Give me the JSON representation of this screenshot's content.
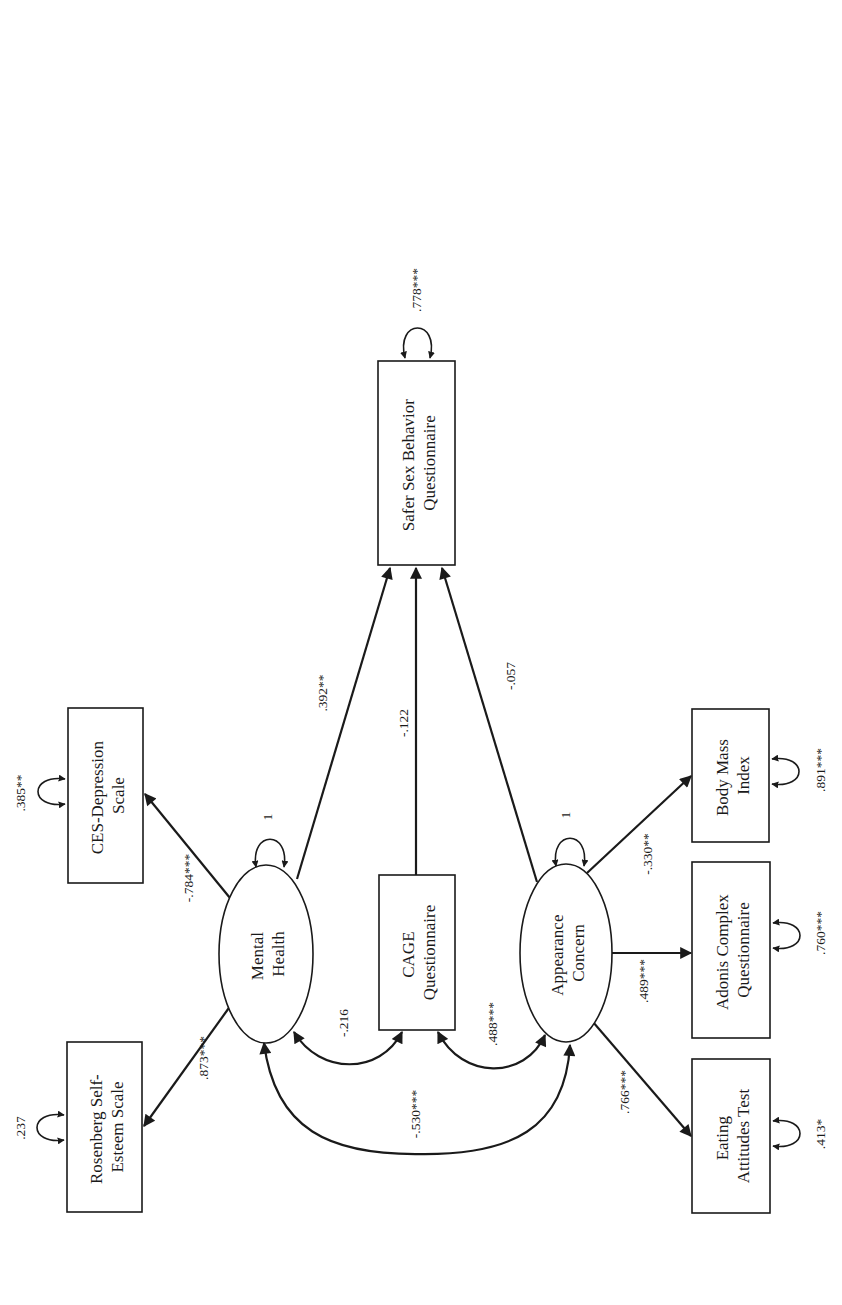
{
  "diagram": {
    "type": "structural-equation-model",
    "orientation": "rotated-90-ccw",
    "colors": {
      "stroke": "#1a1a1a",
      "background": "#ffffff"
    },
    "nodes": {
      "rosenberg": {
        "kind": "observed",
        "lines": [
          "Rosenberg Self-",
          "Esteem Scale"
        ],
        "error_variance": ".237"
      },
      "ces": {
        "kind": "observed",
        "lines": [
          "CES-Depression",
          "Scale"
        ],
        "error_variance": ".385**"
      },
      "mental_health": {
        "kind": "latent",
        "lines": [
          "Mental",
          "Health"
        ],
        "variance": "1"
      },
      "cage": {
        "kind": "observed",
        "lines": [
          "CAGE",
          "Questionnaire"
        ]
      },
      "appearance": {
        "kind": "latent",
        "lines": [
          "Appearance",
          "Concern"
        ],
        "variance": "1"
      },
      "safer_sex": {
        "kind": "observed",
        "lines": [
          "Safer Sex Behavior",
          "Questionnaire"
        ],
        "error_variance": ".778***"
      },
      "eating": {
        "kind": "observed",
        "lines": [
          "Eating",
          "Attitudes Test"
        ],
        "error_variance": ".413*"
      },
      "adonis": {
        "kind": "observed",
        "lines": [
          "Adonis Complex",
          "Questionnaire"
        ],
        "error_variance": ".760***"
      },
      "bmi": {
        "kind": "observed",
        "lines": [
          "Body Mass",
          "Index"
        ],
        "error_variance": ".891***"
      }
    },
    "paths": {
      "mh_to_rosenberg": {
        "from": "Mental Health",
        "to": "Rosenberg Self-Esteem Scale",
        "coef": ".873***"
      },
      "mh_to_ces": {
        "from": "Mental Health",
        "to": "CES-Depression Scale",
        "coef": "-.784***"
      },
      "mh_to_safer_sex": {
        "from": "Mental Health",
        "to": "Safer Sex Behavior Questionnaire",
        "coef": ".392**"
      },
      "cage_to_safer_sex": {
        "from": "CAGE Questionnaire",
        "to": "Safer Sex Behavior Questionnaire",
        "coef": "-.122"
      },
      "ac_to_safer_sex": {
        "from": "Appearance Concern",
        "to": "Safer Sex Behavior Questionnaire",
        "coef": "-.057"
      },
      "ac_to_eating": {
        "from": "Appearance Concern",
        "to": "Eating Attitudes Test",
        "coef": ".766***"
      },
      "ac_to_adonis": {
        "from": "Appearance Concern",
        "to": "Adonis Complex Questionnaire",
        "coef": ".489***"
      },
      "ac_to_bmi": {
        "from": "Appearance Concern",
        "to": "Body Mass Index",
        "coef": "-.330**"
      }
    },
    "covariances": {
      "mh_cage": {
        "between": [
          "Mental Health",
          "CAGE Questionnaire"
        ],
        "coef": "-.216"
      },
      "cage_ac": {
        "between": [
          "CAGE Questionnaire",
          "Appearance Concern"
        ],
        "coef": ".488***"
      },
      "mh_ac": {
        "between": [
          "Mental Health",
          "Appearance Concern"
        ],
        "coef": "-.530***"
      }
    }
  }
}
